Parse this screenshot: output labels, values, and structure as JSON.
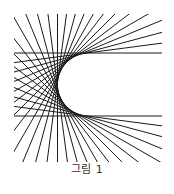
{
  "figure": {
    "caption": "그림 1",
    "type": "tangent-line envelope of a circle",
    "line_color": "#1a1a1a",
    "background": "#ffffff",
    "circle_center": [
      89,
      84.5
    ],
    "circle_radius": 31.5,
    "clip_box": [
      14,
      14,
      162,
      162
    ],
    "tangent_angle_start_deg": 90,
    "tangent_angle_end_deg": 270,
    "tangent_count": 25
  }
}
